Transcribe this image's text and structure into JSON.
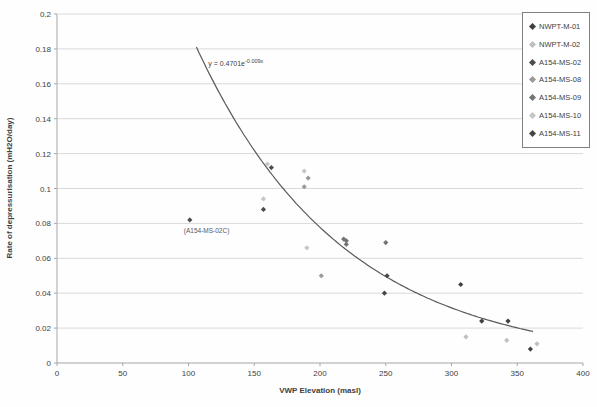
{
  "chart_data": {
    "type": "scatter",
    "title": "",
    "xlabel": "VWP Elevation (masl)",
    "ylabel": "Rate of depressurisation (mH2O/day)",
    "xlim": [
      0,
      400
    ],
    "ylim": [
      0,
      0.2
    ],
    "x_ticks": [
      "0",
      "50",
      "100",
      "150",
      "200",
      "250",
      "300",
      "350",
      "400"
    ],
    "y_ticks": [
      "0",
      "0.02",
      "0.04",
      "0.06",
      "0.08",
      "0.1",
      "0.12",
      "0.14",
      "0.16",
      "0.18",
      "0.2"
    ],
    "grid": "horizontal-only",
    "legend_position": "top-right",
    "trendline": {
      "equation_base": "y = 0.4701e",
      "equation_exponent": "-0.009x",
      "a": 0.4701,
      "b": -0.009,
      "x_start": 106,
      "x_end": 363,
      "color": "#595959"
    },
    "annotation": {
      "text": "(A154-MS-02C)",
      "x": 101,
      "y": 0.082
    },
    "series": [
      {
        "name": "NWPT-M-01",
        "color": "#404040",
        "points": [
          [
            307,
            0.045
          ],
          [
            323,
            0.024
          ],
          [
            343,
            0.024
          ]
        ]
      },
      {
        "name": "NWPT-M-02",
        "color": "#bfbfbf",
        "points": [
          [
            311,
            0.015
          ],
          [
            342,
            0.013
          ],
          [
            365,
            0.011
          ]
        ]
      },
      {
        "name": "A154-MS-02",
        "color": "#4d4d4d",
        "points": [
          [
            101,
            0.082
          ],
          [
            157,
            0.088
          ],
          [
            163,
            0.112
          ]
        ]
      },
      {
        "name": "A154-MS-08",
        "color": "#999999",
        "points": [
          [
            188,
            0.101
          ],
          [
            191,
            0.106
          ],
          [
            201,
            0.05
          ]
        ]
      },
      {
        "name": "A154-MS-09",
        "color": "#737373",
        "points": [
          [
            218,
            0.071
          ],
          [
            220,
            0.07
          ],
          [
            220,
            0.068
          ],
          [
            250,
            0.069
          ]
        ]
      },
      {
        "name": "A154-MS-10",
        "color": "#c6c6c6",
        "points": [
          [
            157,
            0.094
          ],
          [
            160,
            0.114
          ],
          [
            188,
            0.11
          ],
          [
            190,
            0.066
          ]
        ]
      },
      {
        "name": "A154-MS-11",
        "color": "#454545",
        "points": [
          [
            249,
            0.04
          ],
          [
            251,
            0.05
          ],
          [
            360,
            0.008
          ]
        ]
      }
    ],
    "colors": {
      "gridline": "#d9d9d9",
      "axis": "#a6a6a6",
      "text": "#404040",
      "annotation_text": "#595959",
      "background": "#ffffff"
    }
  }
}
